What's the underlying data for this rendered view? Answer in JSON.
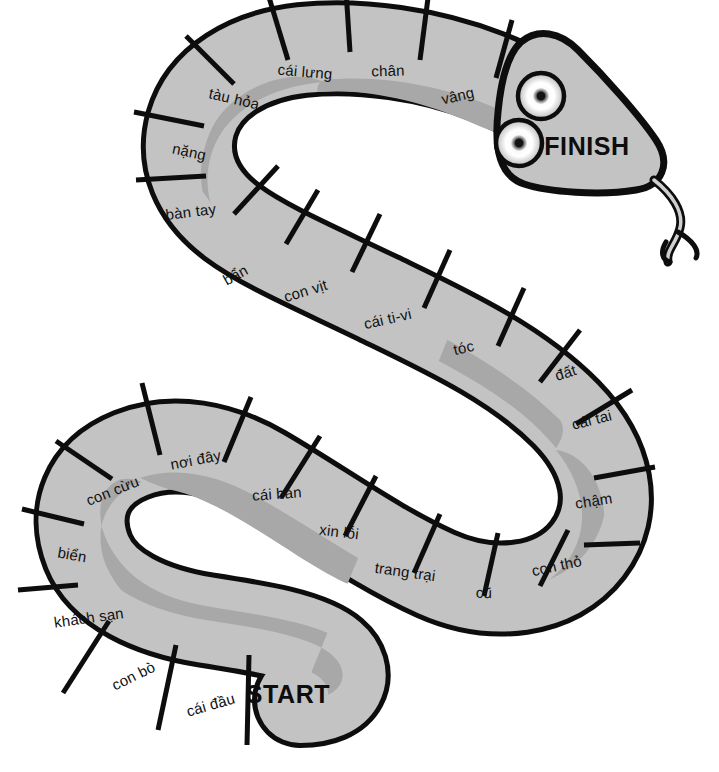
{
  "board": {
    "title": "Vietnamese vocabulary snake board game",
    "colors": {
      "body_fill": "#c3c3c3",
      "stripe": "#a8a8a8",
      "outline": "#0d0d0d",
      "background": "#ffffff",
      "text": "#111111",
      "eye_outer": "#c9c9c9",
      "eye_highlight": "#ffffff",
      "eye_pupil": "#111111"
    },
    "start_label": "START",
    "finish_label": "FINISH",
    "segment_count": 24,
    "segments": [
      {
        "index": 1,
        "label": "cái đầu",
        "x": 211,
        "y": 706,
        "rotate": -16
      },
      {
        "index": 2,
        "label": "con bò",
        "x": 134,
        "y": 677,
        "rotate": -26
      },
      {
        "index": 3,
        "label": "khách sạn",
        "x": 89,
        "y": 619,
        "rotate": -8
      },
      {
        "index": 4,
        "label": "biển",
        "x": 72,
        "y": 556,
        "rotate": 10
      },
      {
        "index": 5,
        "label": "con cừu",
        "x": 113,
        "y": 492,
        "rotate": -22
      },
      {
        "index": 6,
        "label": "nơi đây",
        "x": 196,
        "y": 461,
        "rotate": -11
      },
      {
        "index": 7,
        "label": "cái bàn",
        "x": 277,
        "y": 495,
        "rotate": -4
      },
      {
        "index": 8,
        "label": "xin lỗi",
        "x": 339,
        "y": 533,
        "rotate": 7
      },
      {
        "index": 9,
        "label": "trang trại",
        "x": 405,
        "y": 573,
        "rotate": 8
      },
      {
        "index": 10,
        "label": "cũ",
        "x": 484,
        "y": 594,
        "rotate": 1
      },
      {
        "index": 11,
        "label": "con thỏ",
        "x": 557,
        "y": 567,
        "rotate": -12
      },
      {
        "index": 12,
        "label": "chậm",
        "x": 594,
        "y": 502,
        "rotate": -9
      },
      {
        "index": 13,
        "label": "cái tai",
        "x": 592,
        "y": 421,
        "rotate": -14
      },
      {
        "index": 14,
        "label": "đất",
        "x": 566,
        "y": 374,
        "rotate": -18
      },
      {
        "index": 15,
        "label": "tóc",
        "x": 464,
        "y": 349,
        "rotate": -13
      },
      {
        "index": 16,
        "label": "cái ti-vi",
        "x": 388,
        "y": 320,
        "rotate": -13
      },
      {
        "index": 17,
        "label": "con vịt",
        "x": 306,
        "y": 292,
        "rotate": -17
      },
      {
        "index": 18,
        "label": "bẩn",
        "x": 236,
        "y": 276,
        "rotate": -29
      },
      {
        "index": 19,
        "label": "bàn tay",
        "x": 191,
        "y": 213,
        "rotate": -7
      },
      {
        "index": 20,
        "label": "nặng",
        "x": 189,
        "y": 153,
        "rotate": 12
      },
      {
        "index": 21,
        "label": "tàu hỏa",
        "x": 234,
        "y": 100,
        "rotate": 13
      },
      {
        "index": 22,
        "label": "cái lưng",
        "x": 305,
        "y": 73,
        "rotate": 5
      },
      {
        "index": 23,
        "label": "chân",
        "x": 388,
        "y": 72,
        "rotate": -2
      },
      {
        "index": 24,
        "label": "vâng",
        "x": 458,
        "y": 97,
        "rotate": -13
      }
    ]
  }
}
